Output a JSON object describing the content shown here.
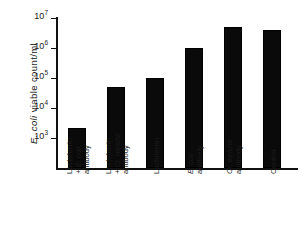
{
  "chart_data": {
    "type": "bar",
    "title": "",
    "xlabel": "",
    "ylabel": "E. coli viable count/ml",
    "yscale": "log",
    "ylim": [
      1000,
      10000000
    ],
    "grid": false,
    "legend": null,
    "ytick_labels": [
      "10⁷",
      "10⁶",
      "10⁵",
      "10⁴",
      "10³"
    ],
    "ytick_values": [
      10000000,
      1000000,
      100000,
      10000,
      1000
    ],
    "categories": [
      "Lactoferrin + E. coli antibody",
      "Lactoferrin + Cl. welchii antibody",
      "Lactoferrin",
      "E. coli antibody",
      "Cl. welchii antibody",
      "Control"
    ],
    "values": [
      2200,
      50000,
      100000,
      1000000,
      5000000,
      4000000
    ],
    "bar_color": "#0a0a0a"
  },
  "axis": {
    "y_title_prefix": "E. coli",
    "y_title_rest": " viable count/ml",
    "ticks": [
      {
        "mantissa": "10",
        "exponent": "7"
      },
      {
        "mantissa": "10",
        "exponent": "6"
      },
      {
        "mantissa": "10",
        "exponent": "5"
      },
      {
        "mantissa": "10",
        "exponent": "4"
      },
      {
        "mantissa": "10",
        "exponent": "3"
      }
    ]
  },
  "x_labels": [
    {
      "lines": [
        "Lactoferrin",
        "+ E. coli",
        "antibody"
      ],
      "italic_line": 1,
      "italic_text": "+ E. coli"
    },
    {
      "lines": [
        "Lactoferrin",
        "+ Cl. welchii",
        "antibody"
      ],
      "italic_line": 1,
      "italic_text": "+ Cl. welchii"
    },
    {
      "lines": [
        "Lactoferrin"
      ],
      "italic_line": -1,
      "italic_text": ""
    },
    {
      "lines": [
        "E. coli",
        "antibody"
      ],
      "italic_line": 0,
      "italic_text": "E. coli"
    },
    {
      "lines": [
        "Cl. welchii",
        "antibody"
      ],
      "italic_line": 0,
      "italic_text": "Cl. welchii"
    },
    {
      "lines": [
        "Control"
      ],
      "italic_line": -1,
      "italic_text": ""
    }
  ]
}
